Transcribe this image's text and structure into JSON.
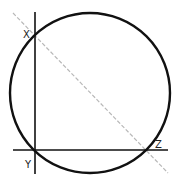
{
  "diagram": {
    "colors": {
      "stroke": "#111111",
      "diagonal": "#b8b8b8",
      "background": "#ffffff",
      "label": "#222222"
    },
    "circle": {
      "cx": 90,
      "cy": 93,
      "r": 80
    },
    "vertical_line": {
      "x": 35,
      "y1": 12,
      "y2": 174
    },
    "horizontal_line": {
      "y": 150,
      "x1": 13,
      "x2": 168
    },
    "diagonal_line": {
      "x1": 13,
      "y1": 13,
      "x2": 168,
      "y2": 173,
      "style": "dashed"
    },
    "points": [
      {
        "name": "X",
        "x": 35,
        "y": 36
      },
      {
        "name": "Y",
        "x": 35,
        "y": 150
      },
      {
        "name": "Z",
        "x": 146,
        "y": 150
      }
    ],
    "labels": {
      "x": "X",
      "y": "Y",
      "z": "Z"
    }
  }
}
